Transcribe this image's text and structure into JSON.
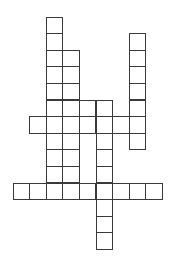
{
  "puzzle": {
    "type": "crossword",
    "origin": {
      "x": 13,
      "y": 17
    },
    "cell_size": 16.6,
    "line_color": "#3a3a3a",
    "background": "#ffffff",
    "rows": [
      {
        "row": 0,
        "cols": [
          2
        ]
      },
      {
        "row": 1,
        "cols": [
          2,
          7
        ]
      },
      {
        "row": 2,
        "cols": [
          2,
          3,
          7
        ]
      },
      {
        "row": 3,
        "cols": [
          2,
          3,
          7
        ]
      },
      {
        "row": 4,
        "cols": [
          2,
          3,
          7
        ]
      },
      {
        "row": 5,
        "cols": [
          2,
          3,
          4,
          5,
          7
        ]
      },
      {
        "row": 6,
        "cols": [
          1,
          2,
          3,
          4,
          5,
          6,
          7
        ]
      },
      {
        "row": 7,
        "cols": [
          2,
          3,
          5,
          7
        ]
      },
      {
        "row": 8,
        "cols": [
          2,
          3,
          5
        ]
      },
      {
        "row": 9,
        "cols": [
          2,
          3,
          5
        ]
      },
      {
        "row": 10,
        "cols": [
          0,
          1,
          2,
          3,
          4,
          5,
          6,
          7,
          8
        ]
      },
      {
        "row": 11,
        "cols": [
          5
        ]
      },
      {
        "row": 12,
        "cols": [
          5
        ]
      },
      {
        "row": 13,
        "cols": [
          5
        ]
      }
    ]
  }
}
